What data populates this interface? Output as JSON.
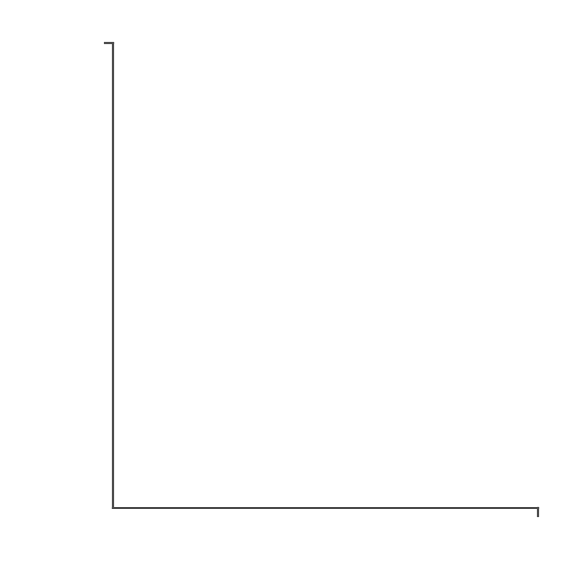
{
  "figure": {
    "background_color": "#ffffff",
    "ink_color": "#4a4a4a"
  },
  "chart_data": {
    "type": "scatter",
    "title": "",
    "subtitle": "",
    "xlabel": "Sediment Pb (ratio Pb/Fe concentrations HCl extraction)",
    "ylabel": "Scrobicularia plana Pb concentration (µg/g)",
    "ylabel_italic_part": "Scrobicularia plana",
    "ylabel_roman_part": " Pb concentration (µg/g)",
    "xlim": [
      0,
      200
    ],
    "ylim": [
      0,
      1000
    ],
    "xticks": [
      0,
      40,
      80,
      120,
      160,
      200
    ],
    "yticks": [
      0,
      200,
      400,
      600,
      800,
      1000
    ],
    "xtick_labels": [
      "0",
      "40",
      "80",
      "120",
      "160",
      "200"
    ],
    "ytick_labels": [
      "0",
      "200",
      "400",
      "600",
      "800",
      "1,000"
    ],
    "grid": false,
    "legend": false,
    "legend_position": "none",
    "marker": {
      "shape": "open-circle",
      "radius_px": 5,
      "stroke_color": "#4a4a4a",
      "fill": "none"
    },
    "series": [
      {
        "name": "Scrobicularia plana Pb vs sediment Pb/Fe",
        "marker": "open-circle",
        "points": [
          [
            2,
            14
          ],
          [
            3,
            30
          ],
          [
            3,
            52
          ],
          [
            4,
            20
          ],
          [
            4,
            42
          ],
          [
            5,
            8
          ],
          [
            5,
            28
          ],
          [
            5,
            62
          ],
          [
            6,
            36
          ],
          [
            6,
            16
          ],
          [
            7,
            48
          ],
          [
            7,
            70
          ],
          [
            8,
            24
          ],
          [
            8,
            56
          ],
          [
            9,
            34
          ],
          [
            9,
            12
          ],
          [
            10,
            64
          ],
          [
            10,
            44
          ],
          [
            11,
            26
          ],
          [
            11,
            80
          ],
          [
            12,
            52
          ],
          [
            12,
            18
          ],
          [
            13,
            68
          ],
          [
            13,
            38
          ],
          [
            14,
            58
          ],
          [
            14,
            30
          ],
          [
            15,
            86
          ],
          [
            15,
            46
          ],
          [
            16,
            22
          ],
          [
            16,
            72
          ],
          [
            17,
            54
          ],
          [
            17,
            96
          ],
          [
            18,
            40
          ],
          [
            18,
            66
          ],
          [
            19,
            104
          ],
          [
            19,
            30
          ],
          [
            20,
            78
          ],
          [
            20,
            50
          ],
          [
            21,
            112
          ],
          [
            21,
            62
          ],
          [
            22,
            90
          ],
          [
            22,
            36
          ],
          [
            23,
            70
          ],
          [
            23,
            124
          ],
          [
            24,
            58
          ],
          [
            25,
            100
          ],
          [
            25,
            132
          ],
          [
            26,
            82
          ],
          [
            26,
            146
          ],
          [
            27,
            140
          ],
          [
            27,
            118
          ],
          [
            28,
            158
          ],
          [
            29,
            128
          ],
          [
            30,
            170
          ],
          [
            40,
            193
          ],
          [
            63,
            378
          ],
          [
            73,
            308
          ],
          [
            95,
            425
          ],
          [
            188,
            1000
          ]
        ]
      }
    ],
    "trend_line": {
      "type": "linear",
      "through_origin": true,
      "slope": 5.1,
      "intercept": 0,
      "x_start": 0,
      "y_start": 0,
      "x_end": 200,
      "y_end": 1020,
      "color": "#4a4a4a"
    }
  }
}
